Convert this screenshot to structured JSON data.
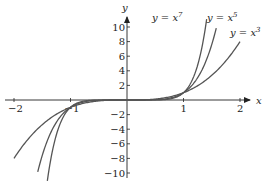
{
  "chart_data": {
    "type": "line",
    "title": "",
    "xlabel": "x",
    "ylabel": "y",
    "xlim": [
      -2.2,
      2.4
    ],
    "ylim": [
      -10.5,
      11.5
    ],
    "grid": false,
    "legend": "inline labels near curve ends",
    "x_ticks": [
      "-2",
      "-1",
      "1",
      "2"
    ],
    "y_ticks": [
      "10",
      "8",
      "6",
      "4",
      "2",
      "-2",
      "-4",
      "-6",
      "-8",
      "-10"
    ],
    "series": [
      {
        "name": "y = x^7",
        "label_base": "y = x",
        "exponent": "7",
        "function": "x^7",
        "x_range": [
          -1.41,
          1.41
        ]
      },
      {
        "name": "y = x^5",
        "label_base": "y = x",
        "exponent": "5",
        "function": "x^5",
        "x_range": [
          -1.58,
          1.58
        ]
      },
      {
        "name": "y = x^3",
        "label_base": "y = x",
        "exponent": "3",
        "function": "x^3",
        "x_range": [
          -2.0,
          2.0
        ]
      }
    ],
    "line_color": "#555555",
    "axis_color": "#222222"
  }
}
